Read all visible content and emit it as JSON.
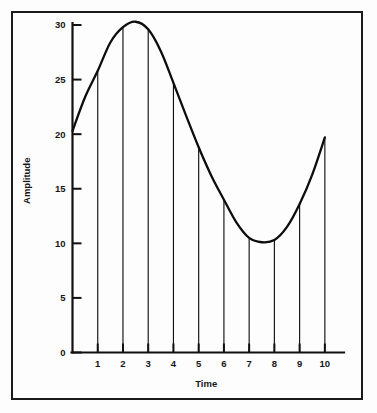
{
  "chart_data": {
    "type": "line",
    "title": "",
    "xlabel": "Time",
    "ylabel": "Amplitude",
    "xlim": [
      0,
      10.6
    ],
    "ylim": [
      0,
      31.2
    ],
    "grid": false,
    "legend": null,
    "x_ticks": [
      1,
      2,
      3,
      4,
      5,
      6,
      7,
      8,
      9,
      10
    ],
    "x_tick_labels": [
      "1",
      "2",
      "3",
      "4",
      "5",
      "6",
      "7",
      "8",
      "9",
      "10"
    ],
    "y_ticks": [
      0,
      5,
      10,
      15,
      20,
      25,
      30
    ],
    "y_tick_labels": [
      "0",
      "5",
      "10",
      "15",
      "20",
      "25",
      "30"
    ],
    "series": [
      {
        "name": "amplitude",
        "style": "smooth-curve-with-drop-lines",
        "color": "#0d0d0d",
        "x": [
          0,
          0.5,
          1,
          1.5,
          2,
          2.5,
          3,
          3.5,
          4,
          4.5,
          5,
          5.5,
          6,
          6.5,
          7,
          7.5,
          8,
          8.5,
          9,
          9.5,
          10
        ],
        "values": [
          20.3,
          23.4,
          25.8,
          28.4,
          29.8,
          30.3,
          29.6,
          27.6,
          24.7,
          21.7,
          18.8,
          16.2,
          14.0,
          11.9,
          10.5,
          10.1,
          10.3,
          11.5,
          13.6,
          16.3,
          19.7
        ]
      }
    ],
    "drop_lines": {
      "x": [
        1,
        2,
        3,
        4,
        5,
        6,
        7,
        8,
        9,
        10
      ],
      "tops": [
        25.8,
        29.8,
        29.6,
        24.7,
        18.8,
        14.0,
        10.5,
        10.3,
        13.6,
        19.7
      ],
      "baseline": 0
    },
    "annotations": []
  },
  "axes": {
    "x_title": "Time",
    "y_title": "Amplitude"
  }
}
